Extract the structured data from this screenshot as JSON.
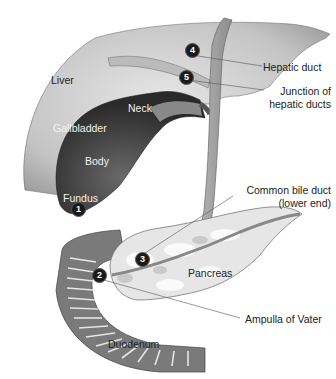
{
  "figure": {
    "title": ""
  },
  "labels": {
    "liver": "Liver",
    "neck": "Neck",
    "gallbladder": "Gallbladder",
    "body": "Body",
    "fundus": "Fundus",
    "hepatic_duct": "Hepatic duct",
    "junction_line1": "Junction of",
    "junction_line2": "hepatic ducts",
    "cbd_line1": "Common bile duct",
    "cbd_line2": "(lower end)",
    "pancreas": "Pancreas",
    "ampulla": "Ampulla of Vater",
    "duodenum": "Duodenum"
  },
  "markers": [
    {
      "number": "1",
      "target": "Fundus"
    },
    {
      "number": "2",
      "target": "Ampulla of Vater"
    },
    {
      "number": "3",
      "target": "Common bile duct (lower end)"
    },
    {
      "number": "4",
      "target": "Hepatic duct"
    },
    {
      "number": "5",
      "target": "Junction of hepatic ducts"
    }
  ],
  "colors": {
    "liver": "#c8c8c8",
    "gallbladder": "#3a3a3a",
    "duct": "#a8a8a8",
    "pancreas": "#e4e4e4",
    "duodenum": "#7a7a7a",
    "marker": "#1a1a1a"
  }
}
